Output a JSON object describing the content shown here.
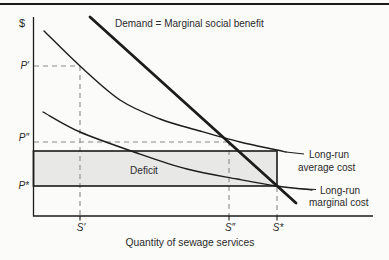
{
  "figure": {
    "y_axis_symbol": "$",
    "x_axis_label": "Quantity of sewage services",
    "demand_label": "Demand = Marginal social benefit",
    "deficit_label": "Deficit",
    "price_labels": {
      "p_prime": "P′",
      "p_double_prime": "P″",
      "p_star": "P*"
    },
    "quantity_labels": {
      "s_prime": "S′",
      "s_double_prime": "S″",
      "s_star": "S*"
    },
    "lac_label": {
      "line1": "Long-run",
      "line2": "average cost"
    },
    "lmc_label": {
      "line1": "Long-run",
      "line2": "marginal cost"
    }
  },
  "chart_data": {
    "type": "line",
    "xlabel": "Quantity of sewage services",
    "ylabel": "$",
    "grid": false,
    "axis_numeric_labels": false,
    "key_values_px": {
      "P_prime_y": 66,
      "P_double_prime_y": 142,
      "P_star_y": 186,
      "S_prime_x": 80,
      "S_double_prime_x": 229,
      "S_star_x": 277
    },
    "axes_px": {
      "origin": [
        33.5,
        216
      ],
      "y_top": 17,
      "x_right": 373
    },
    "x_tick_px": [
      80,
      229,
      277
    ],
    "deficit_rect": {
      "x1": 33.5,
      "y1": 151,
      "x2": 277,
      "y2": 186
    },
    "guides": [
      {
        "name": "p-prime-horizontal",
        "from": [
          34,
          66
        ],
        "to": [
          80,
          66
        ]
      },
      {
        "name": "s-prime-vertical",
        "from": [
          80,
          66
        ],
        "to": [
          80,
          216
        ]
      },
      {
        "name": "p-double-prime-horizontal",
        "from": [
          34,
          142
        ],
        "to": [
          229,
          142
        ]
      },
      {
        "name": "s-double-prime-vertical",
        "from": [
          229,
          141
        ],
        "to": [
          229,
          216
        ]
      },
      {
        "name": "s-star-vertical",
        "from": [
          277,
          187
        ],
        "to": [
          277,
          216
        ]
      }
    ],
    "series": [
      {
        "name": "Long-run average cost",
        "kind": "smooth",
        "width": 1.4,
        "points": [
          [
            44,
            31
          ],
          [
            80,
            66
          ],
          [
            120,
            100
          ],
          [
            160,
            119
          ],
          [
            200,
            131
          ],
          [
            240,
            142
          ],
          [
            277,
            150
          ],
          [
            286,
            152
          ]
        ],
        "leader": [
          [
            286,
            152
          ],
          [
            304,
            154
          ]
        ]
      },
      {
        "name": "Long-run marginal cost",
        "kind": "smooth",
        "width": 1.4,
        "points": [
          [
            43,
            112
          ],
          [
            80,
            132
          ],
          [
            137,
            153
          ],
          [
            187,
            169
          ],
          [
            237,
            179
          ],
          [
            277,
            186
          ],
          [
            312,
            190
          ]
        ],
        "leader": [
          [
            296,
            188.5
          ],
          [
            316,
            189.5
          ]
        ]
      },
      {
        "name": "Demand = Marginal social benefit",
        "kind": "straight",
        "width": 2.8,
        "points": [
          [
            90,
            17
          ],
          [
            296,
            203
          ]
        ]
      }
    ],
    "intersections_px": {
      "demand_x_lac": [
        229,
        141
      ],
      "demand_x_lmc": [
        277,
        186
      ]
    },
    "colors": {
      "line": "#1c1c1c",
      "dashed": "#8a8a8a",
      "fill": "#e8e8e7",
      "text": "#2a2a2a",
      "rect_border": "#262626"
    }
  }
}
